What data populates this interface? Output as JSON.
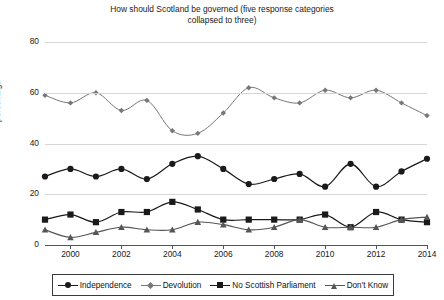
{
  "chart_data": {
    "type": "line",
    "title": "How should Scotland be governed (five response categories collapsed to three)",
    "title_line1": "How should Scotland be governed (five response categories",
    "title_line2": "collapsed to three)",
    "xlabel": "",
    "ylabel": "percentage",
    "ylim": [
      0,
      80
    ],
    "yticks": [
      0,
      20,
      40,
      60,
      80
    ],
    "ytick_labels": [
      "0",
      "20",
      "40",
      "60",
      "80"
    ],
    "grid": "horizontal",
    "legend_position": "bottom",
    "x": [
      1999,
      2000,
      2001,
      2002,
      2003,
      2004,
      2005,
      2006,
      2007,
      2008,
      2009,
      2010,
      2011,
      2012,
      2013,
      2014
    ],
    "xticks": [
      2000,
      2002,
      2004,
      2006,
      2008,
      2010,
      2012,
      2014
    ],
    "xtick_labels": [
      "2000",
      "2002",
      "2004",
      "2006",
      "2008",
      "2010",
      "2012",
      "2014"
    ],
    "series": [
      {
        "name": "Independence",
        "marker": "circle",
        "color": "#1a1a1a",
        "values": [
          27,
          30,
          27,
          30,
          26,
          32,
          35,
          30,
          24,
          26,
          28,
          23,
          32,
          23,
          29,
          34
        ]
      },
      {
        "name": "Devolution",
        "marker": "diamond",
        "color": "#777777",
        "values": [
          59,
          56,
          60,
          53,
          57,
          45,
          44,
          52,
          62,
          58,
          56,
          61,
          58,
          61,
          56,
          51
        ]
      },
      {
        "name": "No Scottish Parliament",
        "marker": "square",
        "color": "#1a1a1a",
        "values": [
          10,
          12,
          9,
          13,
          13,
          17,
          14,
          10,
          10,
          10,
          10,
          12,
          7,
          13,
          10,
          9
        ]
      },
      {
        "name": "Don't Know",
        "marker": "triangle",
        "color": "#555555",
        "values": [
          6,
          3,
          5,
          7,
          6,
          6,
          9,
          8,
          6,
          7,
          10,
          7,
          7,
          7,
          10,
          11
        ]
      }
    ]
  },
  "legend": {
    "items": [
      {
        "label": "Independence",
        "marker": "circle",
        "color": "#1a1a1a"
      },
      {
        "label": "Devolution",
        "marker": "diamond",
        "color": "#777777"
      },
      {
        "label": "No Scottish Parliament",
        "marker": "square",
        "color": "#1a1a1a"
      },
      {
        "label": "Don't Know",
        "marker": "triangle",
        "color": "#555555"
      }
    ]
  }
}
